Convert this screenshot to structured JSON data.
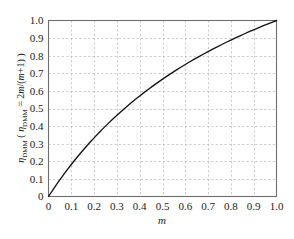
{
  "chart_data": {
    "type": "line",
    "title": "",
    "xlabel": "m",
    "ylabel": "ηDMM ( ηDMM = 2m/(m+1) )",
    "ylabel_parts": {
      "eta": "η",
      "sub": "DMM",
      "open_paren": " ( ",
      "eta2": "η",
      "sub2": "DMM",
      "equals": " = 2",
      "m1": "m",
      "slash": "/(",
      "m2": "m",
      "tail": "+1) )"
    },
    "xlim": [
      0,
      1.0
    ],
    "ylim": [
      0,
      1.0
    ],
    "grid": true,
    "grid_style": "dashed",
    "grid_color": "#b4b4b4",
    "frame_color": "#6e6e6e",
    "curve_color": "#141414",
    "legend": "none",
    "formula": "2m/(m+1)",
    "xticks": [
      0,
      0.1,
      0.2,
      0.3,
      0.4,
      0.5,
      0.6,
      0.7,
      0.8,
      0.9,
      1.0
    ],
    "xticklabels": [
      "0",
      "0.1",
      "0.2",
      "0.3",
      "0.4",
      "0.5",
      "0.6",
      "0.7",
      "0.8",
      "0.9",
      "1.0"
    ],
    "yticks": [
      0,
      0.1,
      0.2,
      0.3,
      0.4,
      0.5,
      0.6,
      0.7,
      0.8,
      0.9,
      1.0
    ],
    "yticklabels": [
      "0",
      "0.1",
      "0.2",
      "0.3",
      "0.4",
      "0.5",
      "0.6",
      "0.7",
      "0.8",
      "0.9",
      "1.0"
    ],
    "series": [
      {
        "name": "eta_DMM",
        "x": [
          0.0,
          0.02,
          0.04,
          0.06,
          0.08,
          0.1,
          0.12,
          0.14,
          0.16,
          0.18,
          0.2,
          0.22,
          0.24,
          0.26,
          0.28,
          0.3,
          0.32,
          0.34,
          0.36,
          0.38,
          0.4,
          0.42,
          0.44,
          0.46,
          0.48,
          0.5,
          0.52,
          0.54,
          0.56,
          0.58,
          0.6,
          0.62,
          0.64,
          0.66,
          0.68,
          0.7,
          0.72,
          0.74,
          0.76,
          0.78,
          0.8,
          0.82,
          0.84,
          0.86,
          0.88,
          0.9,
          0.92,
          0.94,
          0.96,
          0.98,
          1.0
        ],
        "y": [
          0.0,
          0.0392,
          0.0769,
          0.1132,
          0.1481,
          0.1818,
          0.2143,
          0.2456,
          0.2759,
          0.3051,
          0.3333,
          0.3607,
          0.3871,
          0.4127,
          0.4375,
          0.4615,
          0.4848,
          0.5075,
          0.5294,
          0.5507,
          0.5714,
          0.5915,
          0.6111,
          0.6301,
          0.6486,
          0.6667,
          0.6842,
          0.7013,
          0.7179,
          0.7342,
          0.75,
          0.7654,
          0.7805,
          0.7952,
          0.8095,
          0.8235,
          0.8372,
          0.8506,
          0.8636,
          0.8764,
          0.8889,
          0.9011,
          0.913,
          0.9247,
          0.9362,
          0.9474,
          0.9583,
          0.9691,
          0.9796,
          0.9899,
          1.0
        ]
      }
    ]
  }
}
